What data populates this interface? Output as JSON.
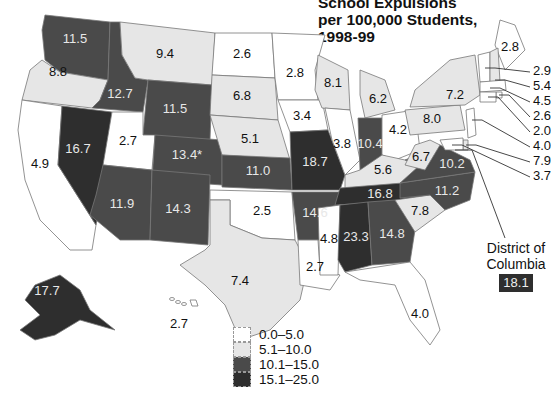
{
  "chart_data": {
    "type": "choropleth",
    "title": "School Expulsions\nper 100,000 Students,\n1998-99",
    "legend": {
      "placement": "bottom-center",
      "bins": [
        {
          "label": "0.0–5.0",
          "min": 0.0,
          "max": 5.0,
          "color": "#ffffff"
        },
        {
          "label": "5.1–10.0",
          "min": 5.1,
          "max": 10.0,
          "color": "#e6e6e6"
        },
        {
          "label": "10.1–15.0",
          "min": 10.1,
          "max": 15.0,
          "color": "#4a4a4a"
        },
        {
          "label": "15.1–25.0",
          "min": 15.1,
          "max": 25.0,
          "color": "#2e2e2e"
        }
      ]
    },
    "states": [
      {
        "state": "WA",
        "value": 11.5,
        "label": "11.5"
      },
      {
        "state": "OR",
        "value": 8.8,
        "label": "8.8"
      },
      {
        "state": "CA",
        "value": 4.9,
        "label": "4.9"
      },
      {
        "state": "NV",
        "value": 16.7,
        "label": "16.7"
      },
      {
        "state": "ID",
        "value": 12.7,
        "label": "12.7"
      },
      {
        "state": "MT",
        "value": 9.4,
        "label": "9.4"
      },
      {
        "state": "WY",
        "value": 11.5,
        "label": "11.5"
      },
      {
        "state": "UT",
        "value": 2.7,
        "label": "2.7"
      },
      {
        "state": "CO",
        "value": 13.4,
        "label": "13.4*"
      },
      {
        "state": "AZ",
        "value": 11.9,
        "label": "11.9"
      },
      {
        "state": "NM",
        "value": 14.3,
        "label": "14.3"
      },
      {
        "state": "ND",
        "value": 2.6,
        "label": "2.6"
      },
      {
        "state": "SD",
        "value": 6.8,
        "label": "6.8"
      },
      {
        "state": "NE",
        "value": 5.1,
        "label": "5.1"
      },
      {
        "state": "KS",
        "value": 11.0,
        "label": "11.0"
      },
      {
        "state": "OK",
        "value": 2.5,
        "label": "2.5"
      },
      {
        "state": "TX",
        "value": 7.4,
        "label": "7.4"
      },
      {
        "state": "MN",
        "value": 2.8,
        "label": "2.8"
      },
      {
        "state": "IA",
        "value": 3.4,
        "label": "3.4"
      },
      {
        "state": "MO",
        "value": 18.7,
        "label": "18.7"
      },
      {
        "state": "AR",
        "value": 14.6,
        "label": "14.6"
      },
      {
        "state": "LA",
        "value": 2.7,
        "label": "2.7"
      },
      {
        "state": "WI",
        "value": 8.1,
        "label": "8.1"
      },
      {
        "state": "IL",
        "value": 3.8,
        "label": "3.8"
      },
      {
        "state": "MI",
        "value": 6.2,
        "label": "6.2"
      },
      {
        "state": "IN",
        "value": 10.4,
        "label": "10.4"
      },
      {
        "state": "OH",
        "value": 4.2,
        "label": "4.2"
      },
      {
        "state": "KY",
        "value": 5.6,
        "label": "5.6"
      },
      {
        "state": "TN",
        "value": 16.8,
        "label": "16.8"
      },
      {
        "state": "MS",
        "value": 4.8,
        "label": "4.8"
      },
      {
        "state": "AL",
        "value": 23.3,
        "label": "23.3"
      },
      {
        "state": "GA",
        "value": 14.8,
        "label": "14.8"
      },
      {
        "state": "FL",
        "value": 4.0,
        "label": "4.0"
      },
      {
        "state": "SC",
        "value": 7.8,
        "label": "7.8"
      },
      {
        "state": "NC",
        "value": 11.2,
        "label": "11.2"
      },
      {
        "state": "VA",
        "value": 10.2,
        "label": "10.2"
      },
      {
        "state": "WV",
        "value": 6.7,
        "label": "6.7"
      },
      {
        "state": "PA",
        "value": 8.0,
        "label": "8.0"
      },
      {
        "state": "NY",
        "value": 7.2,
        "label": "7.2"
      },
      {
        "state": "ME",
        "value": 2.8,
        "label": "2.8"
      },
      {
        "state": "AK",
        "value": 17.7,
        "label": "17.7"
      },
      {
        "state": "HI",
        "value": 2.7,
        "label": "2.7"
      }
    ],
    "northeast_callouts": [
      {
        "value": 2.9,
        "label": "2.9"
      },
      {
        "value": 5.4,
        "label": "5.4"
      },
      {
        "value": 4.5,
        "label": "4.5"
      },
      {
        "value": 2.6,
        "label": "2.6"
      },
      {
        "value": 2.0,
        "label": "2.0"
      },
      {
        "value": 4.0,
        "label": "4.0"
      },
      {
        "value": 7.9,
        "label": "7.9"
      },
      {
        "value": 3.7,
        "label": "3.7"
      }
    ],
    "dc": {
      "label": "District of\nColumbia",
      "value": 18.1,
      "value_label": "18.1"
    }
  }
}
